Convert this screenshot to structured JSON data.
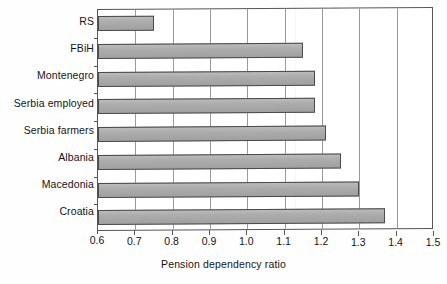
{
  "figure": {
    "kind": "bar-chart",
    "bar_fill_color": "#a9a9a9",
    "bar_border_color": "#4a4a4a",
    "grid_color": "#9a9a9a",
    "axis_color": "#555555",
    "text_color": "#141414",
    "background_color": "#ffffff"
  },
  "chart_data": {
    "type": "bar",
    "orientation": "horizontal",
    "title": "",
    "xlabel": "Pension dependency ratio",
    "ylabel": "",
    "xlim": [
      0.6,
      1.5
    ],
    "xticks": [
      "0.6",
      "0.7",
      "0.8",
      "0.9",
      "1.0",
      "1.1",
      "1.2",
      "1.3",
      "1.4",
      "1.5"
    ],
    "xtick_values": [
      0.6,
      0.7,
      0.8,
      0.9,
      1.0,
      1.1,
      1.2,
      1.3,
      1.4,
      1.5
    ],
    "grid": true,
    "grid_axis": "x",
    "legend": false,
    "legend_position": "none",
    "categories": [
      "RS",
      "FBiH",
      "Montenegro",
      "Serbia employed",
      "Serbia farmers",
      "Albania",
      "Macedonia",
      "Croatia"
    ],
    "values": [
      0.75,
      1.15,
      1.18,
      1.18,
      1.21,
      1.25,
      1.3,
      1.37
    ],
    "series": [
      {
        "name": "Pension dependency ratio",
        "values": [
          0.75,
          1.15,
          1.18,
          1.18,
          1.21,
          1.25,
          1.3,
          1.37
        ]
      }
    ]
  }
}
